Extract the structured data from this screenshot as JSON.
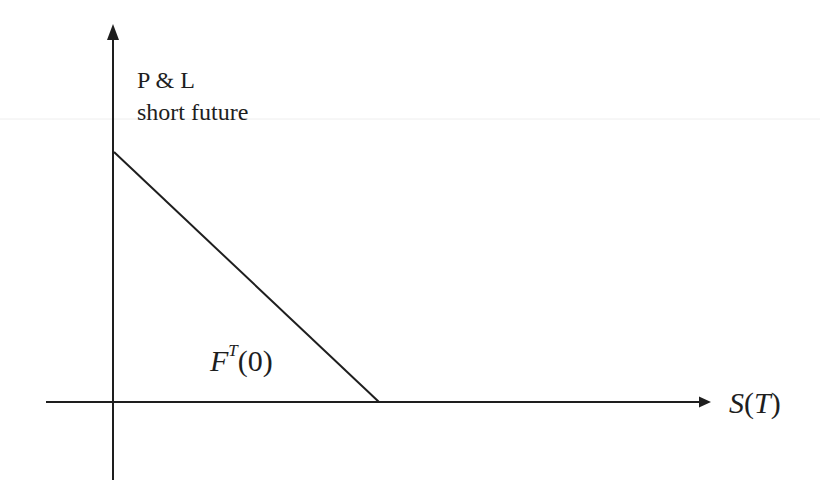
{
  "diagram": {
    "y_axis": {
      "label_line1": "P & L",
      "label_line2": "short future"
    },
    "x_axis": {
      "label_var": "S",
      "label_open": "(",
      "label_arg": "T",
      "label_close": ")"
    },
    "annotation": {
      "symbol": "F",
      "superscript": "T",
      "argument": "(0)"
    },
    "payoff_line": {
      "description": "P&L decreases linearly with S(T), crossing zero at F^T(0)",
      "start": {
        "x": 114,
        "y": 152
      },
      "end": {
        "x": 379,
        "y": 402
      }
    },
    "colors": {
      "line": "#1e1e1e",
      "background": "#ffffff",
      "scan_artifact": "#ececec"
    }
  }
}
